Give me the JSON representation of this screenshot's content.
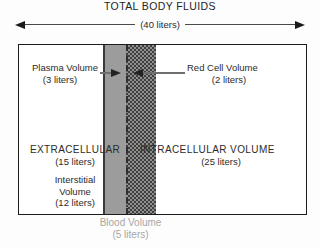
{
  "header": {
    "title": "TOTAL BODY FLUIDS",
    "total_volume": "(40 liters)"
  },
  "compartments": {
    "plasma": {
      "label": "Plasma Volume",
      "volume": "(3 liters)"
    },
    "red_cell": {
      "label": "Red Cell Volume",
      "volume": "(2 liters)"
    },
    "extracellular": {
      "label": "EXTRACELLULAR",
      "volume": "(15 liters)"
    },
    "interstitial": {
      "label_line1": "Interstitial",
      "label_line2": "Volume",
      "volume": "(12 liters)"
    },
    "intracellular": {
      "label": "INTRACELLULAR VOLUME",
      "volume": "(25 liters)"
    },
    "blood": {
      "label": "Blood Volume",
      "volume": "(5 liters)"
    }
  },
  "colors": {
    "plasma_band": "#9c9c9c",
    "red_cell_dot": "#3f3f3f",
    "blood_label_text": "#a6a6a6",
    "box_border": "#1c1c1c"
  }
}
